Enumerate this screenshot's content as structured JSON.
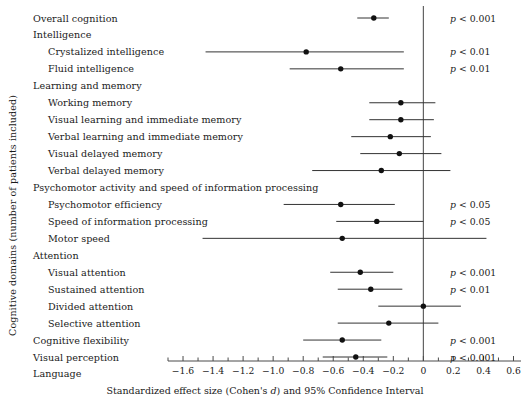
{
  "chart_data": {
    "type": "scatter",
    "subtype": "forest-plot",
    "title": "",
    "xlabel": "Standardized effect size (Cohen's d) and 95% Confidence Interval",
    "ylabel": "Cognitive domains (number of patients included)",
    "xlim": [
      -1.7,
      0.65
    ],
    "xticks": [
      -1.6,
      -1.4,
      -1.2,
      -1.0,
      -0.8,
      -0.6,
      -0.4,
      -0.2,
      0,
      0.2,
      0.4,
      0.6
    ],
    "xticklabels": [
      "−1.6",
      "−1.4",
      "−1.2",
      "−1.0",
      "−0.8",
      "−0.6",
      "−0.4",
      "−0.2",
      "0",
      "0.2",
      "0.4",
      "0.6"
    ],
    "minor_tick_step": 0.1,
    "grid": false,
    "reference_line": 0,
    "legend": "none",
    "rows": [
      {
        "label": "Overall cognition",
        "indent": 0,
        "effect": -0.33,
        "ci_low": -0.44,
        "ci_high": -0.23,
        "p": "p < 0.001"
      },
      {
        "label": "Intelligence",
        "indent": 0,
        "effect": null,
        "ci_low": null,
        "ci_high": null,
        "p": ""
      },
      {
        "label": "Crystalized intelligence",
        "indent": 1,
        "effect": -0.78,
        "ci_low": -1.45,
        "ci_high": -0.13,
        "p": "p < 0.01"
      },
      {
        "label": "Fluid intelligence",
        "indent": 1,
        "effect": -0.55,
        "ci_low": -0.89,
        "ci_high": -0.13,
        "p": "p < 0.01"
      },
      {
        "label": "Learning and memory",
        "indent": 0,
        "effect": null,
        "ci_low": null,
        "ci_high": null,
        "p": ""
      },
      {
        "label": "Working memory",
        "indent": 1,
        "effect": -0.15,
        "ci_low": -0.36,
        "ci_high": 0.08,
        "p": ""
      },
      {
        "label": "Visual learning and immediate memory",
        "indent": 1,
        "effect": -0.15,
        "ci_low": -0.36,
        "ci_high": 0.07,
        "p": ""
      },
      {
        "label": "Verbal learning and immediate memory",
        "indent": 1,
        "effect": -0.22,
        "ci_low": -0.48,
        "ci_high": 0.05,
        "p": ""
      },
      {
        "label": "Visual delayed memory",
        "indent": 1,
        "effect": -0.16,
        "ci_low": -0.42,
        "ci_high": 0.12,
        "p": ""
      },
      {
        "label": "Verbal delayed memory",
        "indent": 1,
        "effect": -0.28,
        "ci_low": -0.74,
        "ci_high": 0.18,
        "p": ""
      },
      {
        "label": "Psychomotor activity and speed of information processing",
        "indent": 0,
        "effect": null,
        "ci_low": null,
        "ci_high": null,
        "p": ""
      },
      {
        "label": "Psychomotor efficiency",
        "indent": 1,
        "effect": -0.55,
        "ci_low": -0.93,
        "ci_high": -0.19,
        "p": "p < 0.05"
      },
      {
        "label": "Speed of information processing",
        "indent": 1,
        "effect": -0.31,
        "ci_low": -0.58,
        "ci_high": 0.0,
        "p": "p < 0.05"
      },
      {
        "label": "Motor speed",
        "indent": 1,
        "effect": -0.54,
        "ci_low": -1.47,
        "ci_high": 0.42,
        "p": ""
      },
      {
        "label": "Attention",
        "indent": 0,
        "effect": null,
        "ci_low": null,
        "ci_high": null,
        "p": ""
      },
      {
        "label": "Visual attention",
        "indent": 1,
        "effect": -0.42,
        "ci_low": -0.62,
        "ci_high": -0.2,
        "p": "p < 0.001"
      },
      {
        "label": "Sustained attention",
        "indent": 1,
        "effect": -0.35,
        "ci_low": -0.57,
        "ci_high": -0.14,
        "p": "p < 0.01"
      },
      {
        "label": "Divided attention",
        "indent": 1,
        "effect": 0.0,
        "ci_low": -0.3,
        "ci_high": 0.25,
        "p": ""
      },
      {
        "label": "Selective attention",
        "indent": 1,
        "effect": -0.23,
        "ci_low": -0.57,
        "ci_high": 0.1,
        "p": ""
      },
      {
        "label": "Cognitive flexibility",
        "indent": 0,
        "effect": -0.54,
        "ci_low": -0.8,
        "ci_high": -0.28,
        "p": "p < 0.001"
      },
      {
        "label": "Visual perception",
        "indent": 0,
        "effect": -0.45,
        "ci_low": -0.67,
        "ci_high": -0.24,
        "p": "p < 0.001"
      },
      {
        "label": "Language",
        "indent": 0,
        "effect": null,
        "ci_low": null,
        "ci_high": null,
        "p": ""
      }
    ]
  },
  "colors": {
    "marker": "#111111",
    "line": "#333333",
    "axis": "#4a4a4a",
    "reference": "#555555",
    "text": "#1a1a1a"
  },
  "axis": {
    "xlabel_prefix": "Standardized effect size (Cohen's ",
    "xlabel_italic": "d",
    "xlabel_suffix": ") and 95% Confidence Interval",
    "ylabel": "Cognitive domains (number of patients included)"
  }
}
